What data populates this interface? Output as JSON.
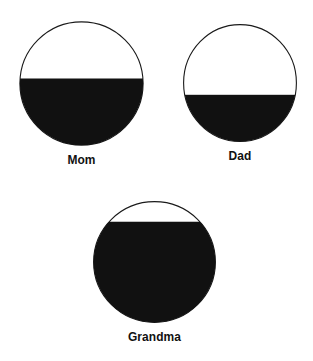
{
  "page": {
    "background_color": "#ffffff",
    "ink_color": "#111111",
    "width": 313,
    "height": 361
  },
  "chart_data": {
    "type": "pie",
    "title": "",
    "subtitle": "",
    "xlabel": "",
    "ylabel": "",
    "legend": [],
    "units": "fraction filled (0-1)",
    "categories": [
      "Mom",
      "Dad",
      "Grandma"
    ],
    "values": [
      0.54,
      0.4,
      0.83
    ],
    "percent_labels": [
      "54%",
      "40%",
      "83%"
    ],
    "series": [
      {
        "name": "Filled portion",
        "values": [
          0.54,
          0.4,
          0.83
        ]
      }
    ]
  },
  "figures": [
    {
      "id": "mom",
      "label": "Mom",
      "fill_fraction": 0.54,
      "diameter": 125,
      "fill_color": "#111111",
      "outline_color": "#1a1a1a"
    },
    {
      "id": "dad",
      "label": "Dad",
      "fill_fraction": 0.4,
      "diameter": 114,
      "fill_color": "#111111",
      "outline_color": "#1a1a1a"
    },
    {
      "id": "grandma",
      "label": "Grandma",
      "fill_fraction": 0.83,
      "diameter": 123,
      "fill_color": "#111111",
      "outline_color": "#1a1a1a"
    }
  ]
}
